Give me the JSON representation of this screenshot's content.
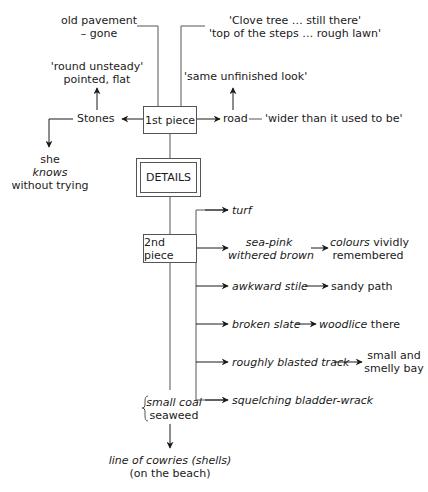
{
  "diagram": {
    "first_piece": {
      "label": "1st piece",
      "top_left": {
        "line1": "old pavement",
        "line2": "– gone"
      },
      "top_right": {
        "line1": "'Clove tree … still there'",
        "line2": "'top of the steps … rough lawn'"
      },
      "stones": {
        "label": "Stones",
        "above": {
          "line1": "'round unsteady'",
          "line2": "pointed, flat"
        },
        "below": {
          "line1": "she",
          "line2": "knows",
          "line3": "without trying"
        }
      },
      "road": {
        "label": "road",
        "quote": "'wider than it used to be'",
        "above": "'same unfinished look'"
      }
    },
    "details": {
      "label": "DETAILS"
    },
    "second_piece": {
      "label": "2nd piece",
      "branches": [
        {
          "item": "turf"
        },
        {
          "item_line1": "sea-pink",
          "item_line2": "withered brown",
          "result_italic": "colours",
          "result_rest": " vividly",
          "result_line2": "remembered"
        },
        {
          "item": "awkward stile",
          "result": "sandy path"
        },
        {
          "item": "broken slate",
          "result_italic": "woodlice",
          "result_rest": " there"
        },
        {
          "item": "roughly blasted track",
          "result_line1": "small and",
          "result_line2": "smelly bay"
        },
        {
          "item": "squelching bladder-wrack"
        }
      ]
    },
    "bottom": {
      "brace_line1": "small coal",
      "brace_line2": "seaweed",
      "final_line1": "line of cowries (shells)",
      "final_line2": "(on the beach)"
    }
  }
}
